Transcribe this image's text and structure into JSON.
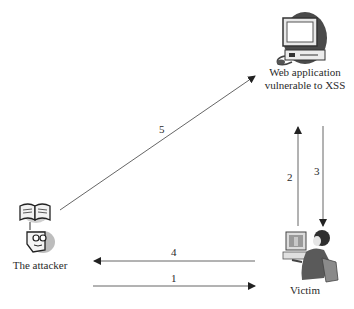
{
  "nodes": {
    "web_app": {
      "label_line1": "Web application",
      "label_line2": "vulnerable to XSS",
      "icon": "server-computer-icon"
    },
    "attacker": {
      "label": "The attacker",
      "icon": "attacker-book-icon"
    },
    "victim": {
      "label": "Victim",
      "icon": "user-at-computer-icon"
    }
  },
  "edges": [
    {
      "id": "1",
      "label": "1",
      "from": "attacker",
      "to": "victim"
    },
    {
      "id": "2",
      "label": "2",
      "from": "victim",
      "to": "web_app"
    },
    {
      "id": "3",
      "label": "3",
      "from": "web_app",
      "to": "victim"
    },
    {
      "id": "4",
      "label": "4",
      "from": "victim",
      "to": "attacker"
    },
    {
      "id": "5",
      "label": "5",
      "from": "attacker",
      "to": "web_app"
    }
  ],
  "colors": {
    "line": "#555555",
    "icon_dark": "#3a3a3a",
    "icon_mid": "#9a9a9a",
    "icon_light": "#d0d0d0"
  }
}
